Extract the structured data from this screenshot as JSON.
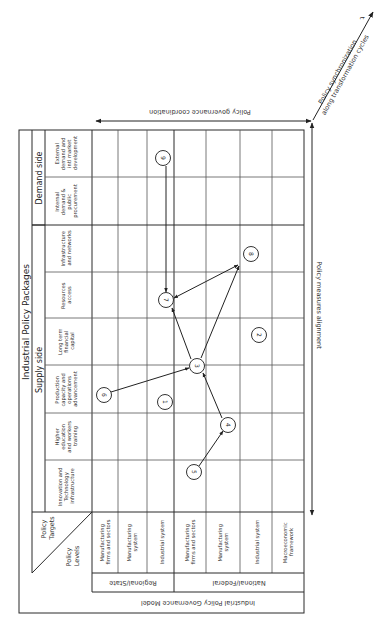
{
  "diagram": {
    "title": "Industrial Policy Packages",
    "supply_side_label": "Supply side",
    "demand_side_label": "Demand side",
    "corner": {
      "targets": "Policy Targets",
      "targets_l1": "Policy",
      "targets_l2": "Targets",
      "levels": "Policy Levels",
      "levels_l1": "Policy",
      "levels_l2": "Levels"
    },
    "columns": [
      {
        "id": "c1",
        "group": "Supply side",
        "lines": [
          "Innovation and",
          "Technology",
          "infrastructure"
        ]
      },
      {
        "id": "c2",
        "group": "Supply side",
        "lines": [
          "Higher",
          "education",
          "and workers",
          "training"
        ]
      },
      {
        "id": "c3",
        "group": "Supply side",
        "lines": [
          "Production",
          "capacity and",
          "operations",
          "advancement"
        ]
      },
      {
        "id": "c4",
        "group": "Supply side",
        "lines": [
          "Long term",
          "financial",
          "capital"
        ]
      },
      {
        "id": "c5",
        "group": "Supply side",
        "lines": [
          "Resources",
          "access"
        ]
      },
      {
        "id": "c6",
        "group": "Supply side",
        "lines": [
          "Infrastructure",
          "and networks"
        ]
      },
      {
        "id": "c7",
        "group": "Demand side",
        "lines": [
          "Internal",
          "demand &",
          "public",
          "procurement"
        ]
      },
      {
        "id": "c8",
        "group": "Demand side",
        "lines": [
          "External",
          "demand and",
          "intl market",
          "development"
        ]
      }
    ],
    "rows": [
      {
        "id": "r1",
        "group": "Regional/State",
        "lines": [
          "Manufacturing",
          "firms and sectors"
        ]
      },
      {
        "id": "r2",
        "group": "Regional/State",
        "lines": [
          "Manufacturing",
          "system"
        ]
      },
      {
        "id": "r3",
        "group": "Regional/State",
        "lines": [
          "Industrial system"
        ]
      },
      {
        "id": "r4",
        "group": "National/Federal",
        "lines": [
          "Manufacturing",
          "firms and sectors"
        ]
      },
      {
        "id": "r5",
        "group": "National/Federal",
        "lines": [
          "Manufacturing",
          "system"
        ]
      },
      {
        "id": "r6",
        "group": "National/Federal",
        "lines": [
          "Industrial system"
        ]
      },
      {
        "id": "r7",
        "group": "National/Federal",
        "lines": [
          "Macroeconomic",
          "framework"
        ]
      }
    ],
    "row_groups": [
      "Regional/State",
      "National/Federal"
    ],
    "governance_model_label": "Industrial Policy Governance Model",
    "nodes": [
      {
        "n": "1",
        "row": "r3",
        "col": "c3"
      },
      {
        "n": "2",
        "row": "r6",
        "col": "c4"
      },
      {
        "n": "3",
        "row": "r4",
        "col": "c3/c4"
      },
      {
        "n": "4",
        "row": "r5",
        "col": "c2"
      },
      {
        "n": "5",
        "row": "r4",
        "col": "c1"
      },
      {
        "n": "6",
        "row": "r1",
        "col": "c3"
      },
      {
        "n": "7",
        "row": "r3",
        "col": "c5"
      },
      {
        "n": "8",
        "row": "r6",
        "col": "c6"
      },
      {
        "n": "9",
        "row": "r3",
        "col": "c8"
      }
    ],
    "edges": [
      {
        "from": "5",
        "to": "4"
      },
      {
        "from": "4",
        "to": "3"
      },
      {
        "from": "6",
        "to": "3"
      },
      {
        "from": "3",
        "to": "7"
      },
      {
        "from": "3",
        "to": "8"
      },
      {
        "from": "9",
        "to": "7"
      },
      {
        "from": "7",
        "to": "8",
        "bidirectional": true
      }
    ],
    "axes": {
      "coordination": "Policy governance coordination",
      "alignment": "Policy measures alignment",
      "sync_line1": "Policy synchronization",
      "sync_line2": "along transformation cycles",
      "time": "t"
    }
  }
}
